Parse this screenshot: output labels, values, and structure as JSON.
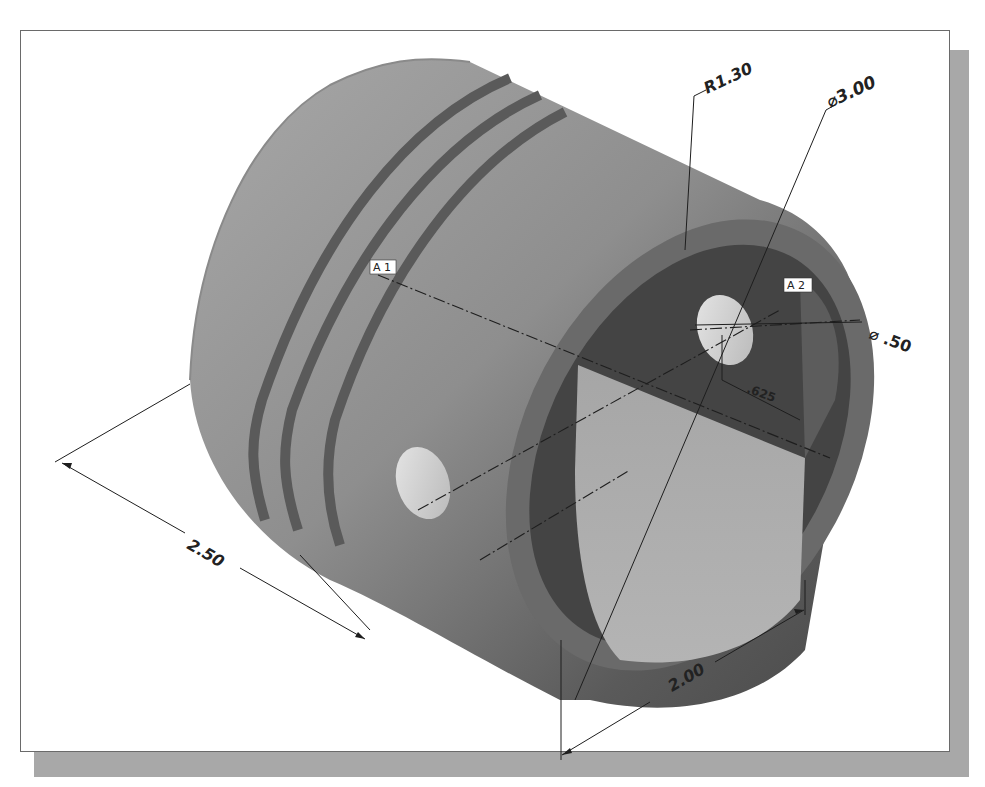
{
  "drawing": {
    "subject": "Piston isometric view with dimensions",
    "dimensions": {
      "radius": "R1.30",
      "outer_diameter": "⌀3.00",
      "pin_hole_diameter": "⌀ .50",
      "pin_offset": ".625",
      "length": "2.50",
      "skirt_width": "2.00"
    },
    "axis_tags": {
      "a1": "A 1",
      "a2": "A 2"
    },
    "colors": {
      "body_light": "#9a9a9a",
      "body_dark": "#5e5e5e",
      "groove": "#595959",
      "inner_dark": "#3f3f3f",
      "inner_light": "#a2a2a2",
      "hole": "#d8d8d8",
      "shadow": "#a8a8a8",
      "frame_border": "#6a6a6a"
    }
  }
}
